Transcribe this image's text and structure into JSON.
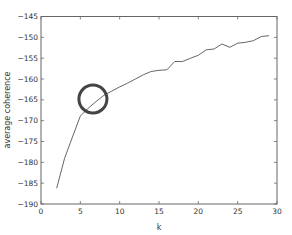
{
  "chart_data": {
    "type": "line",
    "title": "",
    "xlabel": "k",
    "ylabel": "average coherence",
    "xlim": [
      0,
      30
    ],
    "ylim": [
      -190,
      -145
    ],
    "xticks": [
      0,
      5,
      10,
      15,
      20,
      25,
      30
    ],
    "yticks": [
      -145,
      -150,
      -155,
      -160,
      -165,
      -170,
      -175,
      -180,
      -185,
      -190
    ],
    "grid": false,
    "legend": null,
    "series": [
      {
        "name": "average coherence",
        "color": "#555555",
        "x": [
          2,
          3,
          4,
          5,
          6,
          7,
          8,
          9,
          10,
          11,
          12,
          13,
          14,
          15,
          16,
          17,
          18,
          19,
          20,
          21,
          22,
          23,
          24,
          25,
          26,
          27,
          28,
          29
        ],
        "values": [
          -186.2,
          -179.0,
          -173.9,
          -168.9,
          -167.0,
          -165.4,
          -163.9,
          -162.9,
          -161.9,
          -161.0,
          -160.0,
          -159.0,
          -158.2,
          -157.9,
          -157.8,
          -155.8,
          -155.8,
          -155.0,
          -154.3,
          -153.0,
          -152.8,
          -151.6,
          -152.4,
          -151.4,
          -151.2,
          -150.8,
          -149.8,
          -149.6
        ]
      }
    ],
    "annotations": [
      {
        "type": "circle",
        "x": 6.6,
        "y": -164.8,
        "color": "#444444",
        "description": "highlight circle around elbow"
      }
    ]
  }
}
